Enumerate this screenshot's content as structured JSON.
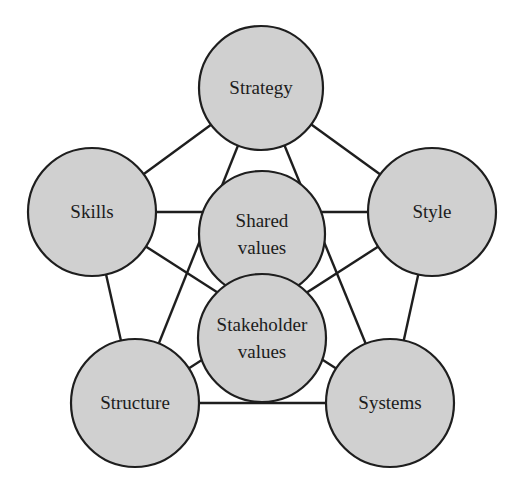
{
  "diagram": {
    "title": "",
    "style": {
      "node_fill": "#d0d0d0",
      "node_stroke": "#1e1e1e",
      "edge_color": "#1e1e1e",
      "background": "#ffffff"
    },
    "nodes": [
      {
        "id": "strategy",
        "label_lines": [
          "Strategy"
        ],
        "cx": 261,
        "cy": 88,
        "r": 62
      },
      {
        "id": "skills",
        "label_lines": [
          "Skills"
        ],
        "cx": 92,
        "cy": 212,
        "r": 64
      },
      {
        "id": "style",
        "label_lines": [
          "Style"
        ],
        "cx": 432,
        "cy": 212,
        "r": 64
      },
      {
        "id": "structure",
        "label_lines": [
          "Structure"
        ],
        "cx": 135,
        "cy": 403,
        "r": 64
      },
      {
        "id": "systems",
        "label_lines": [
          "Systems"
        ],
        "cx": 390,
        "cy": 403,
        "r": 64
      },
      {
        "id": "shared",
        "label_lines": [
          "Shared",
          "values"
        ],
        "cx": 262,
        "cy": 234,
        "r": 63
      },
      {
        "id": "stakeholder",
        "label_lines": [
          "Stakeholder",
          "values"
        ],
        "cx": 262,
        "cy": 338,
        "r": 64
      }
    ],
    "edges": [
      {
        "from": "strategy",
        "to": "skills"
      },
      {
        "from": "strategy",
        "to": "style"
      },
      {
        "from": "skills",
        "to": "structure"
      },
      {
        "from": "style",
        "to": "systems"
      },
      {
        "from": "structure",
        "to": "systems"
      },
      {
        "from": "strategy",
        "to": "structure"
      },
      {
        "from": "strategy",
        "to": "systems"
      },
      {
        "from": "skills",
        "to": "style"
      },
      {
        "from": "skills",
        "to": "systems"
      },
      {
        "from": "style",
        "to": "structure"
      }
    ]
  }
}
